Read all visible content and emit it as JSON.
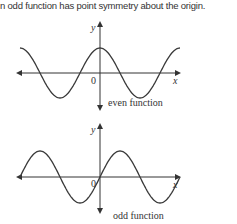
{
  "caption": "n odd function has point symmetry about the origin.",
  "figures": [
    {
      "name": "even",
      "label": "even function",
      "y_axis_label": "y",
      "x_axis_label": "x",
      "origin_label": "0",
      "curve": "cosine"
    },
    {
      "name": "odd",
      "label": "odd function",
      "y_axis_label": "y",
      "x_axis_label": "x",
      "origin_label": "0",
      "curve": "sine"
    }
  ],
  "colors": {
    "line": "#3a3a3a",
    "background": "#ffffff"
  }
}
